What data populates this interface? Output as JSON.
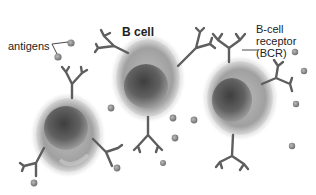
{
  "diagram": {
    "labels": {
      "antigens": "antigens",
      "b_cell": "B cell",
      "bcr_line1": "B-cell",
      "bcr_line2": "receptor",
      "bcr_line3": "(BCR)"
    },
    "colors": {
      "background": "#ffffff",
      "cell_outer": "#9a9a9a",
      "cell_nucleus": "#555555",
      "receptor": "#5e5e5e",
      "antigen": "#8a8a8a",
      "text": "#222222"
    },
    "cells": [
      {
        "name": "left-b-cell",
        "cx": 68,
        "cy": 135,
        "rx": 33,
        "ry": 38
      },
      {
        "name": "middle-b-cell",
        "cx": 148,
        "cy": 78,
        "rx": 33,
        "ry": 40
      },
      {
        "name": "right-b-cell",
        "cx": 240,
        "cy": 98,
        "rx": 34,
        "ry": 38
      }
    ]
  }
}
